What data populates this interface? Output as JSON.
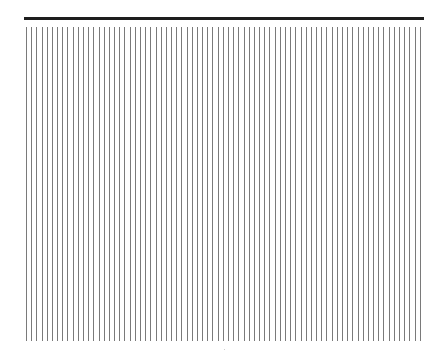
{
  "figure": {
    "top_rule": {
      "color": "#1e1e1e",
      "x_start": 24,
      "x_end": 424,
      "y": 18
    },
    "stripes": {
      "count": 77,
      "color": "#7a7a7a",
      "x_start": 26,
      "spacing": 5.18,
      "y_top": 27,
      "y_bottom": 341
    }
  }
}
